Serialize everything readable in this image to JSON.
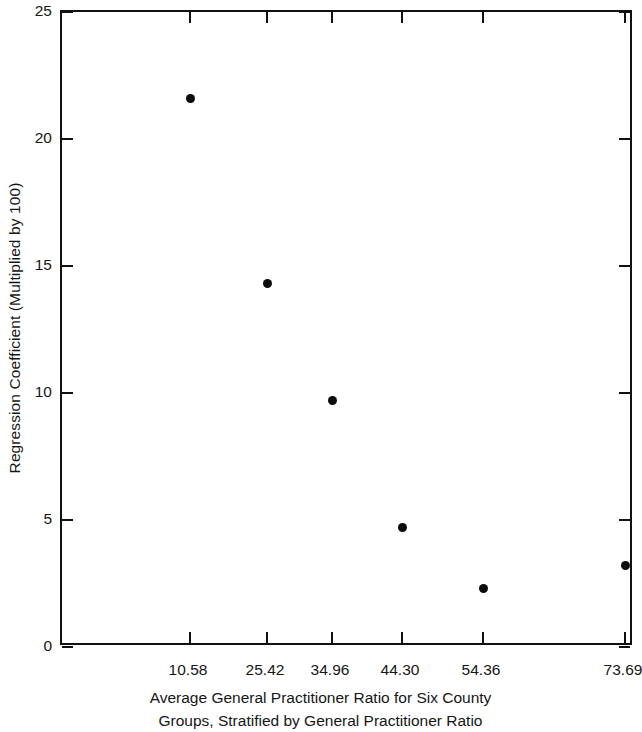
{
  "chart_data": {
    "type": "scatter",
    "title": "",
    "xlabel": "Average General Practitioner Ratio for Six County Groups, Stratified by General Practitioner Ratio",
    "xlabel_line1": "Average General Practitioner Ratio for Six County",
    "xlabel_line2": "Groups, Stratified by General Practitioner Ratio",
    "ylabel": "Regression Coefficient (Multiplied by 100)",
    "categories": [
      "10.58",
      "25.42",
      "34.96",
      "44.30",
      "54.36",
      "73.69"
    ],
    "x": [
      10.58,
      25.42,
      34.96,
      44.3,
      54.36,
      73.69
    ],
    "values": [
      21.6,
      14.3,
      9.7,
      4.7,
      2.3,
      3.2
    ],
    "series": [
      {
        "name": "Regression Coefficient",
        "values": [
          21.6,
          14.3,
          9.7,
          4.7,
          2.3,
          3.2
        ]
      }
    ],
    "ylim": [
      0,
      25
    ],
    "ytick_labels": [
      "0",
      "5",
      "10",
      "15",
      "20",
      "25"
    ],
    "ytick_values": [
      0,
      5,
      10,
      15,
      20,
      25
    ],
    "xtick_labels": [
      "10.58",
      "25.42",
      "34.96",
      "44.30",
      "54.36",
      "73.69"
    ],
    "grid": false,
    "legend": false,
    "legend_position": "none",
    "marker": "filled-circle",
    "marker_color": "#0b0b0b",
    "axis_color": "#111111",
    "background_color": "#ffffff"
  },
  "figure": {
    "frame_style": "full-box-inward-ticks"
  }
}
